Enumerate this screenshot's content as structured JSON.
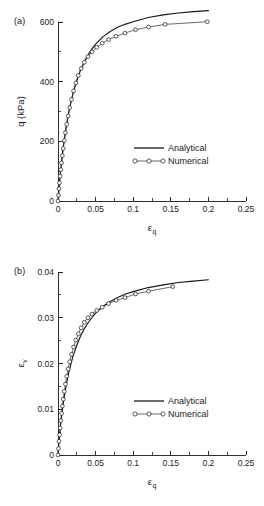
{
  "figure": {
    "panel_a_tag": "(a)",
    "panel_b_tag": "(b)"
  },
  "legend": {
    "analytical": "Analytical",
    "numerical": "Numerical"
  },
  "axis_labels": {
    "x_symbol": "ε",
    "x_subscript": "q",
    "y_a": "q (kPa)",
    "y_b_symbol": "ε",
    "y_b_subscript": "v"
  },
  "ticks": {
    "x_major_labels": [
      "0",
      "0.05",
      "0.1",
      "0.15",
      "0.2",
      "0.25"
    ],
    "y_a_major_labels": [
      "0",
      "200",
      "400",
      "600"
    ],
    "y_b_major_labels": [
      "0",
      "0.01",
      "0.02",
      "0.03",
      "0.04"
    ]
  },
  "chart_data": [
    {
      "type": "line",
      "panel": "(a)",
      "title": "",
      "xlabel": "ε_q",
      "ylabel": "q (kPa)",
      "xlim": [
        0,
        0.25
      ],
      "ylim": [
        0,
        600
      ],
      "xticks": [
        0,
        0.05,
        0.1,
        0.15,
        0.2,
        0.25
      ],
      "xticks_minor": [
        0.025,
        0.075,
        0.125,
        0.175,
        0.225
      ],
      "yticks": [
        0,
        200,
        400,
        600
      ],
      "yticks_minor": [
        100,
        300,
        500
      ],
      "grid": false,
      "legend_position": "center-right",
      "series": [
        {
          "name": "Analytical",
          "style": "solid-line",
          "x": [
            0,
            0.0005,
            0.001,
            0.0015,
            0.002,
            0.003,
            0.004,
            0.005,
            0.006,
            0.008,
            0.01,
            0.0125,
            0.015,
            0.0175,
            0.02,
            0.025,
            0.03,
            0.035,
            0.04,
            0.045,
            0.05,
            0.06,
            0.07,
            0.08,
            0.09,
            0.1,
            0.12,
            0.14,
            0.16,
            0.18,
            0.2
          ],
          "y": [
            0,
            16,
            32,
            47,
            61,
            89,
            114,
            138,
            160,
            200,
            235,
            273,
            306,
            335,
            361,
            404,
            439,
            467,
            490,
            509,
            526,
            551,
            569,
            583,
            593,
            601,
            615,
            624,
            630,
            635,
            638
          ]
        },
        {
          "name": "Numerical",
          "style": "open-circle-markers",
          "x": [
            0,
            0.0006,
            0.0013,
            0.002,
            0.0028,
            0.0037,
            0.0047,
            0.0058,
            0.007,
            0.0084,
            0.0099,
            0.0116,
            0.0135,
            0.0156,
            0.018,
            0.0207,
            0.0237,
            0.027,
            0.0308,
            0.035,
            0.0398,
            0.0452,
            0.0515,
            0.0588,
            0.0673,
            0.0772,
            0.089,
            0.103,
            0.1205,
            0.1425,
            0.1985
          ],
          "y": [
            0,
            19,
            41,
            61,
            83,
            105,
            128,
            152,
            176,
            203,
            229,
            257,
            285,
            313,
            340,
            369,
            396,
            421,
            444,
            465,
            484,
            500,
            515,
            529,
            541,
            552,
            563,
            574,
            583,
            592,
            601
          ]
        }
      ]
    },
    {
      "type": "line",
      "panel": "(b)",
      "title": "",
      "xlabel": "ε_q",
      "ylabel": "ε_v",
      "xlim": [
        0,
        0.25
      ],
      "ylim": [
        0,
        0.04
      ],
      "xticks": [
        0,
        0.05,
        0.1,
        0.15,
        0.2,
        0.25
      ],
      "xticks_minor": [
        0.025,
        0.075,
        0.125,
        0.175,
        0.225
      ],
      "yticks": [
        0,
        0.01,
        0.02,
        0.03,
        0.04
      ],
      "yticks_minor": [
        0.005,
        0.015,
        0.025,
        0.035
      ],
      "grid": false,
      "legend_position": "center-right",
      "series": [
        {
          "name": "Analytical",
          "style": "solid-line",
          "x": [
            0,
            0.0005,
            0.001,
            0.0015,
            0.002,
            0.003,
            0.004,
            0.005,
            0.006,
            0.008,
            0.01,
            0.0125,
            0.015,
            0.0175,
            0.02,
            0.025,
            0.03,
            0.035,
            0.04,
            0.045,
            0.05,
            0.06,
            0.07,
            0.08,
            0.09,
            0.1,
            0.12,
            0.14,
            0.16,
            0.18,
            0.2
          ],
          "y": [
            0,
            0.0012,
            0.0023,
            0.0033,
            0.0042,
            0.0059,
            0.0074,
            0.0088,
            0.0101,
            0.0124,
            0.0144,
            0.0166,
            0.0185,
            0.0201,
            0.0216,
            0.024,
            0.026,
            0.0276,
            0.0289,
            0.03,
            0.031,
            0.0325,
            0.0336,
            0.0345,
            0.0352,
            0.0357,
            0.0366,
            0.0372,
            0.0377,
            0.038,
            0.0383
          ]
        },
        {
          "name": "Numerical",
          "style": "open-circle-markers",
          "x": [
            0,
            0.0006,
            0.0013,
            0.002,
            0.0028,
            0.0037,
            0.0047,
            0.0058,
            0.007,
            0.0084,
            0.0099,
            0.0116,
            0.0135,
            0.0156,
            0.018,
            0.0207,
            0.0237,
            0.027,
            0.0308,
            0.035,
            0.0398,
            0.0452,
            0.0515,
            0.0588,
            0.0673,
            0.0772,
            0.089,
            0.103,
            0.1205,
            0.1525
          ],
          "y": [
            0,
            0.0014,
            0.003,
            0.0044,
            0.0059,
            0.0075,
            0.0091,
            0.0107,
            0.0122,
            0.0139,
            0.0155,
            0.0172,
            0.0188,
            0.0204,
            0.022,
            0.0236,
            0.0251,
            0.0265,
            0.0278,
            0.029,
            0.03,
            0.0308,
            0.0316,
            0.0323,
            0.0331,
            0.0338,
            0.0344,
            0.0352,
            0.0358,
            0.0368
          ]
        }
      ]
    }
  ]
}
